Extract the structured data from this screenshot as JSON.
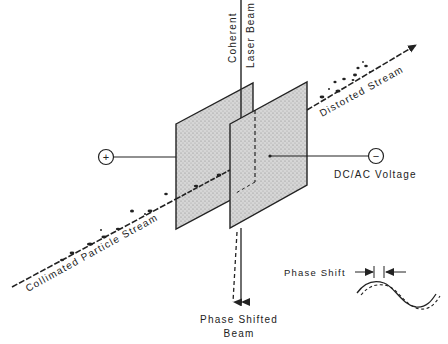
{
  "diagram": {
    "labels": {
      "laser_beam_line1": "Coherent",
      "laser_beam_line2": "Laser Beam",
      "distorted_stream": "Distorted Stream",
      "collimated_stream": "Collimated Particle Stream",
      "voltage": "DC/AC Voltage",
      "phase_shift": "Phase Shift",
      "phase_shifted_line1": "Phase Shifted",
      "phase_shifted_line2": "Beam"
    },
    "terminals": {
      "positive": "+",
      "negative": "−"
    },
    "colors": {
      "ink": "#222222",
      "plate_fill": "#c9c9c9",
      "background": "#ffffff"
    }
  }
}
